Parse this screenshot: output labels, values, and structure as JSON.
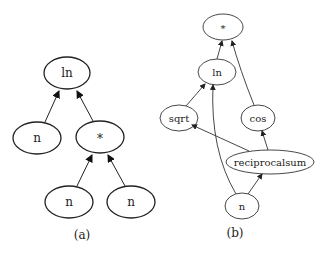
{
  "diagram_a": {
    "caption": "(a)",
    "nodes": [
      {
        "id": "ln",
        "label": "ln"
      },
      {
        "id": "n1",
        "label": "n"
      },
      {
        "id": "mul",
        "label": "*"
      },
      {
        "id": "n2",
        "label": "n"
      },
      {
        "id": "n3",
        "label": "n"
      }
    ],
    "edges": [
      {
        "from": "n1",
        "to": "ln"
      },
      {
        "from": "mul",
        "to": "ln"
      },
      {
        "from": "n2",
        "to": "mul"
      },
      {
        "from": "n3",
        "to": "mul"
      }
    ]
  },
  "diagram_b": {
    "caption": "(b)",
    "nodes": [
      {
        "id": "mul",
        "label": "*"
      },
      {
        "id": "ln",
        "label": "ln"
      },
      {
        "id": "sqrt",
        "label": "sqrt"
      },
      {
        "id": "cos",
        "label": "cos"
      },
      {
        "id": "reciprocalsum",
        "label": "reciprocalsum"
      },
      {
        "id": "n",
        "label": "n"
      }
    ],
    "edges": [
      {
        "from": "ln",
        "to": "mul"
      },
      {
        "from": "cos",
        "to": "mul"
      },
      {
        "from": "sqrt",
        "to": "ln"
      },
      {
        "from": "n",
        "to": "ln"
      },
      {
        "from": "reciprocalsum",
        "to": "sqrt"
      },
      {
        "from": "reciprocalsum",
        "to": "cos"
      },
      {
        "from": "n",
        "to": "reciprocalsum"
      }
    ]
  }
}
